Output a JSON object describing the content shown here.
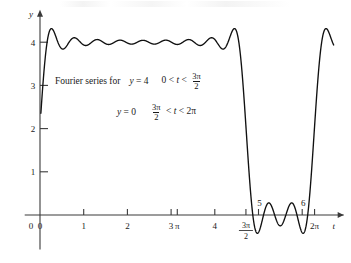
{
  "figure": {
    "caption": {
      "lead": "Fourier series for",
      "line1": {
        "lhs_var": "y",
        "lhs_eq": "=",
        "lhs_val": "4",
        "cond_left": "0 <",
        "cond_var": "t",
        "cond_rel": "<",
        "frac_num": "3π",
        "frac_den": "2"
      },
      "line2": {
        "lhs_var": "y",
        "lhs_eq": "=",
        "lhs_val": "0",
        "frac_num": "3π",
        "frac_den": "2",
        "cond_rel1": "<",
        "cond_var": "t",
        "cond_rel2": "<",
        "cond_right": "2π"
      }
    },
    "axes": {
      "x_name": "t",
      "y_name": "y",
      "x_ticks": [
        {
          "label": "0",
          "value": 0
        },
        {
          "label": "1",
          "value": 1
        },
        {
          "label": "2",
          "value": 2
        },
        {
          "label": "3",
          "value": 3
        },
        {
          "label": "π",
          "value": 3.14159
        },
        {
          "label": "4",
          "value": 4
        },
        {
          "label": "3π/2",
          "value": 4.71239,
          "frac_num": "3π",
          "frac_den": "2"
        },
        {
          "label": "5",
          "value": 5
        },
        {
          "label": "6",
          "value": 6
        },
        {
          "label": "2π",
          "value": 6.28319
        }
      ],
      "y_ticks": [
        {
          "label": "1",
          "value": 1
        },
        {
          "label": "2",
          "value": 2
        },
        {
          "label": "3",
          "value": 3
        },
        {
          "label": "4",
          "value": 4
        }
      ],
      "xlim": [
        -0.35,
        7.05
      ],
      "ylim": [
        -0.45,
        4.75
      ]
    }
  },
  "chart_data": {
    "type": "line",
    "xlabel": "t",
    "ylabel": "y",
    "xlim": [
      -0.35,
      7.05
    ],
    "ylim": [
      -0.45,
      4.75
    ],
    "grid": false,
    "legend": null,
    "square_wave": {
      "period": 6.28319,
      "high_value": 4,
      "low_value": 0,
      "duty_start": 0,
      "duty_end": 4.71239
    },
    "series": [
      {
        "name": "partial sum N=11",
        "harmonics": 11,
        "dc": 3,
        "a0_over_2": 3,
        "form": "3 + sum_{n=1..11} (4/(n*pi))*( sin(3*pi*n/2)*cos(n*t) + (1-cos(3*pi*n/2))*sin(n*t) )"
      }
    ],
    "annotations": {
      "overshoot_peak_y": 4.35,
      "ripple_trough_y": 3.78,
      "undershoot_min_y": -0.35,
      "jump_location_x": 4.71239,
      "rise_location_x": 6.28319
    }
  }
}
